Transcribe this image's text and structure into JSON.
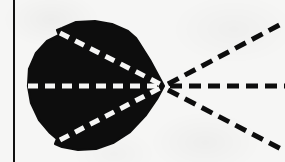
{
  "figure": {
    "domain_label": "scanned-line-figure",
    "canvas": {
      "width": 285,
      "height": 162
    },
    "background_color": "#f6f6f5",
    "ink_color": "#0d0d0d",
    "highlight_color": "#f6f6f5",
    "caption": "",
    "visible_text": []
  },
  "page_border": {
    "name": "vertical-rule",
    "orientation": "vertical",
    "x": 14,
    "y_start": 0,
    "y_end": 162,
    "thickness": 2,
    "color": "#111111"
  },
  "blob": {
    "name": "solid-black-blob",
    "fill_color": "#0d0d0d",
    "bounds": {
      "left": 28,
      "top": 21,
      "right": 168,
      "bottom": 150
    },
    "apex": {
      "x": 164,
      "y": 86
    },
    "description": "irregular filled silhouette, roughly circular on the left and tapering to a point on the right",
    "outline_points": [
      [
        164,
        86
      ],
      [
        150,
        60
      ],
      [
        138,
        41
      ],
      [
        136,
        38
      ],
      [
        128,
        31
      ],
      [
        112,
        24
      ],
      [
        95,
        21
      ],
      [
        76,
        22
      ],
      [
        62,
        28
      ],
      [
        57,
        30
      ],
      [
        59,
        35
      ],
      [
        47,
        41
      ],
      [
        36,
        53
      ],
      [
        29,
        69
      ],
      [
        28,
        86
      ],
      [
        31,
        103
      ],
      [
        39,
        120
      ],
      [
        50,
        133
      ],
      [
        57,
        139
      ],
      [
        55,
        144
      ],
      [
        62,
        147
      ],
      [
        78,
        150
      ],
      [
        96,
        149
      ],
      [
        113,
        143
      ],
      [
        130,
        132
      ],
      [
        146,
        115
      ],
      [
        157,
        99
      ]
    ]
  },
  "rays_inner": {
    "name": "white-dashed-rays-inside-blob",
    "stroke_color": "#f6f6f5",
    "stroke_width": 5,
    "dash_length": 10,
    "dash_gap": 7,
    "count": 3,
    "items": [
      {
        "name": "inner-ray-upper",
        "from": [
          60,
          33
        ],
        "to": [
          164,
          86
        ],
        "angle_deg": -27
      },
      {
        "name": "inner-ray-middle",
        "from": [
          28,
          86
        ],
        "to": [
          164,
          86
        ],
        "angle_deg": 0
      },
      {
        "name": "inner-ray-lower",
        "from": [
          60,
          140
        ],
        "to": [
          164,
          86
        ],
        "angle_deg": 27
      }
    ]
  },
  "rays_outer": {
    "name": "black-dashed-rays-outside-blob",
    "stroke_color": "#0d0d0d",
    "stroke_width": 5,
    "dash_length": 12,
    "dash_gap": 7,
    "count": 3,
    "items": [
      {
        "name": "outer-ray-upper",
        "from": [
          168,
          84
        ],
        "to": [
          285,
          22
        ],
        "angle_deg": -28
      },
      {
        "name": "outer-ray-middle",
        "from": [
          170,
          86
        ],
        "to": [
          285,
          86
        ],
        "angle_deg": 0
      },
      {
        "name": "outer-ray-lower",
        "from": [
          168,
          90
        ],
        "to": [
          285,
          151
        ],
        "angle_deg": 28
      }
    ]
  }
}
